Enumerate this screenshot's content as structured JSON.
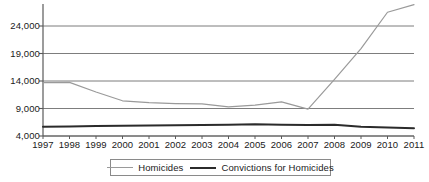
{
  "chart_data": {
    "type": "line",
    "title": "",
    "xlabel": "",
    "ylabel": "",
    "grid": true,
    "legend_position": "bottom",
    "categories": [
      "1997",
      "1998",
      "1999",
      "2000",
      "2001",
      "2002",
      "2003",
      "2004",
      "2005",
      "2006",
      "2007",
      "2008",
      "2009",
      "2010",
      "2011"
    ],
    "x": [
      1997,
      1998,
      1999,
      2000,
      2001,
      2002,
      2003,
      2004,
      2005,
      2006,
      2007,
      2008,
      2009,
      2010,
      2011
    ],
    "ylim": [
      4000,
      28000
    ],
    "yticks": [
      4000,
      9000,
      14000,
      19000,
      24000
    ],
    "ytick_labels": [
      "4,000",
      "9,000",
      "14,000",
      "19,000",
      "24,000"
    ],
    "series": [
      {
        "name": "Homicides",
        "color": "#9a9a9a",
        "values": [
          13700,
          13750,
          12000,
          10400,
          10050,
          9900,
          9850,
          9300,
          9600,
          10200,
          8900,
          14300,
          19900,
          26500,
          27900
        ]
      },
      {
        "name": "Convictions for Homicides",
        "color": "#2b2b2b",
        "values": [
          5700,
          5750,
          5800,
          5850,
          5900,
          5950,
          6000,
          6050,
          6150,
          6050,
          6000,
          6050,
          5700,
          5550,
          5400
        ]
      }
    ]
  },
  "legend": {
    "items": [
      {
        "label": "Homicides",
        "color": "#9a9a9a",
        "width": 1.2
      },
      {
        "label": "Convictions for Homicides",
        "color": "#2b2b2b",
        "width": 2.2
      }
    ]
  },
  "axes": {
    "y_axis_color": "#5a5a5a",
    "x_axis_color": "#5a5a5a",
    "gridline_color": "#6e6e6e"
  }
}
